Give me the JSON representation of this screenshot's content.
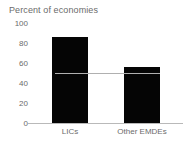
{
  "chart_data": {
    "type": "bar",
    "title": "Percent of economies",
    "xlabel": "",
    "ylabel": "",
    "categories": [
      "LICs",
      "Other EMDEs"
    ],
    "values": [
      86,
      56
    ],
    "ylim": [
      0,
      100
    ],
    "yticks": [
      0,
      20,
      40,
      60,
      80,
      100
    ],
    "ytick_labels": [
      "0",
      "20",
      "40",
      "60",
      "80",
      "100"
    ],
    "grid": false,
    "legend": null,
    "annotations": [
      {
        "name": "reference-line",
        "type": "horizontal-line",
        "value": 50,
        "color": "#b0b0b0"
      }
    ],
    "series": [
      {
        "name": "Percent of economies",
        "color": "#050505",
        "values": [
          86,
          56
        ]
      }
    ]
  },
  "colors": {
    "bar": "#050505",
    "axis": "#b9b9b9",
    "text": "#6b6b6b",
    "reference_line": "#b0b0b0",
    "background": "#ffffff"
  }
}
